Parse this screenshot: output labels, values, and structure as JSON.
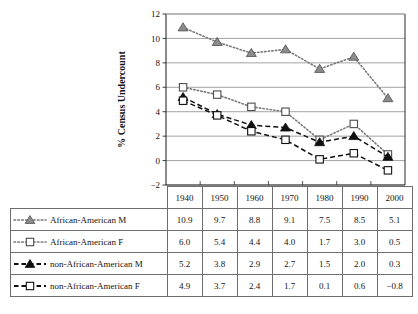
{
  "chart_data": {
    "type": "line",
    "title": "",
    "xlabel": "",
    "ylabel": "% Census Undercount",
    "ylim": [
      -2,
      12
    ],
    "ytick_values": [
      12,
      10,
      8,
      6,
      4,
      2,
      0,
      -2
    ],
    "ytick_labels": [
      "12",
      "10",
      "8",
      "6",
      "4",
      "2",
      "0",
      "−2"
    ],
    "grid": "horizontal",
    "legend_position": "table-below",
    "categories": [
      "1940",
      "1950",
      "1960",
      "1970",
      "1980",
      "1990",
      "2000"
    ],
    "series": [
      {
        "name": "African-American M",
        "values": [
          10.9,
          9.7,
          8.8,
          9.1,
          7.5,
          8.5,
          5.1
        ],
        "display_values": [
          "10.9",
          "9.7",
          "8.8",
          "9.1",
          "7.5",
          "8.5",
          "5.1"
        ],
        "line_style": "dotted",
        "marker": "triangle",
        "marker_fill": "#8c8c8c",
        "marker_stroke": "#4d4d4d",
        "line_color": "#7a7a7a"
      },
      {
        "name": "African-American F",
        "values": [
          6.0,
          5.4,
          4.4,
          4.0,
          1.7,
          3.0,
          0.5
        ],
        "display_values": [
          "6.0",
          "5.4",
          "4.4",
          "4.0",
          "1.7",
          "3.0",
          "0.5"
        ],
        "line_style": "dotted",
        "marker": "square",
        "marker_fill": "#ffffff",
        "marker_stroke": "#4d4d4d",
        "line_color": "#7a7a7a"
      },
      {
        "name": "non-African-American M",
        "values": [
          5.2,
          3.8,
          2.9,
          2.7,
          1.5,
          2.0,
          0.3
        ],
        "display_values": [
          "5.2",
          "3.8",
          "2.9",
          "2.7",
          "1.5",
          "2.0",
          "0.3"
        ],
        "line_style": "dashed",
        "marker": "triangle",
        "marker_fill": "#101010",
        "marker_stroke": "#101010",
        "line_color": "#101010"
      },
      {
        "name": "non-African-American F",
        "values": [
          4.9,
          3.7,
          2.4,
          1.7,
          0.1,
          0.6,
          -0.8
        ],
        "display_values": [
          "4.9",
          "3.7",
          "2.4",
          "1.7",
          "0.1",
          "0.6",
          "−0.8"
        ],
        "line_style": "dashed",
        "marker": "square",
        "marker_fill": "#ffffff",
        "marker_stroke": "#101010",
        "line_color": "#101010"
      }
    ]
  },
  "colors": {
    "grid": "#9a9a9a",
    "axis": "#2b2b2b",
    "table_border": "#6e6e6e",
    "text": "#141414",
    "gray_marker": "#8c8c8c",
    "black_marker": "#101010"
  }
}
